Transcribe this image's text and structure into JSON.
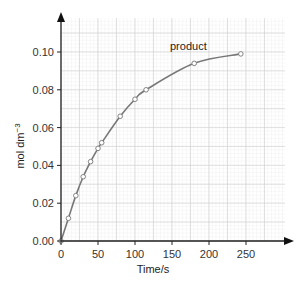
{
  "chart_data": {
    "type": "line",
    "title": "",
    "xlabel": "Time/s",
    "ylabel": "mol dm",
    "ylabel_superscript": "−3",
    "xlim": [
      0,
      295
    ],
    "ylim": [
      0,
      0.12
    ],
    "x_ticks": [
      0,
      50,
      100,
      150,
      200,
      250
    ],
    "x_tick_labels": [
      "0",
      "50",
      "100",
      "150",
      "200",
      "250"
    ],
    "y_ticks": [
      0,
      0.02,
      0.04,
      0.06,
      0.08,
      0.1
    ],
    "y_tick_labels": [
      "0.00",
      "0.02",
      "0.04",
      "0.06",
      "0.08",
      "0.10"
    ],
    "grid": true,
    "legend": "none",
    "series": [
      {
        "name": "product",
        "x": [
          0,
          10,
          20,
          30,
          40,
          50,
          55,
          80,
          100,
          115,
          180,
          243
        ],
        "values": [
          0,
          0.012,
          0.024,
          0.034,
          0.042,
          0.049,
          0.052,
          0.066,
          0.075,
          0.08,
          0.094,
          0.099
        ],
        "color": "#777777",
        "marker": "open-circle"
      }
    ],
    "annotations": [
      {
        "text": "product",
        "x": 150,
        "y": 0.102
      }
    ]
  }
}
